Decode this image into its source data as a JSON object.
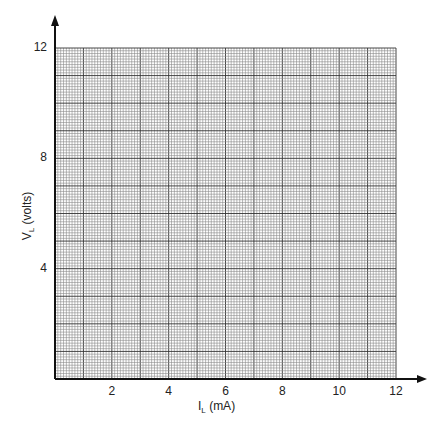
{
  "chart_data": {
    "type": "line",
    "title": "",
    "xlabel": "I_L (mA)",
    "ylabel": "V_L (volts)",
    "x_ticks": [
      2,
      4,
      6,
      8,
      10,
      12
    ],
    "y_ticks": [
      4,
      8,
      12
    ],
    "xlim": [
      0,
      12
    ],
    "ylim": [
      0,
      12
    ],
    "grid": true,
    "grid_minor_divisions": 10,
    "series": []
  },
  "labels": {
    "xlabel_main": "I",
    "xlabel_sub": "L",
    "xlabel_unit": " (mA)",
    "ylabel_main": "V",
    "ylabel_sub": "L",
    "ylabel_unit": " (volts)"
  }
}
